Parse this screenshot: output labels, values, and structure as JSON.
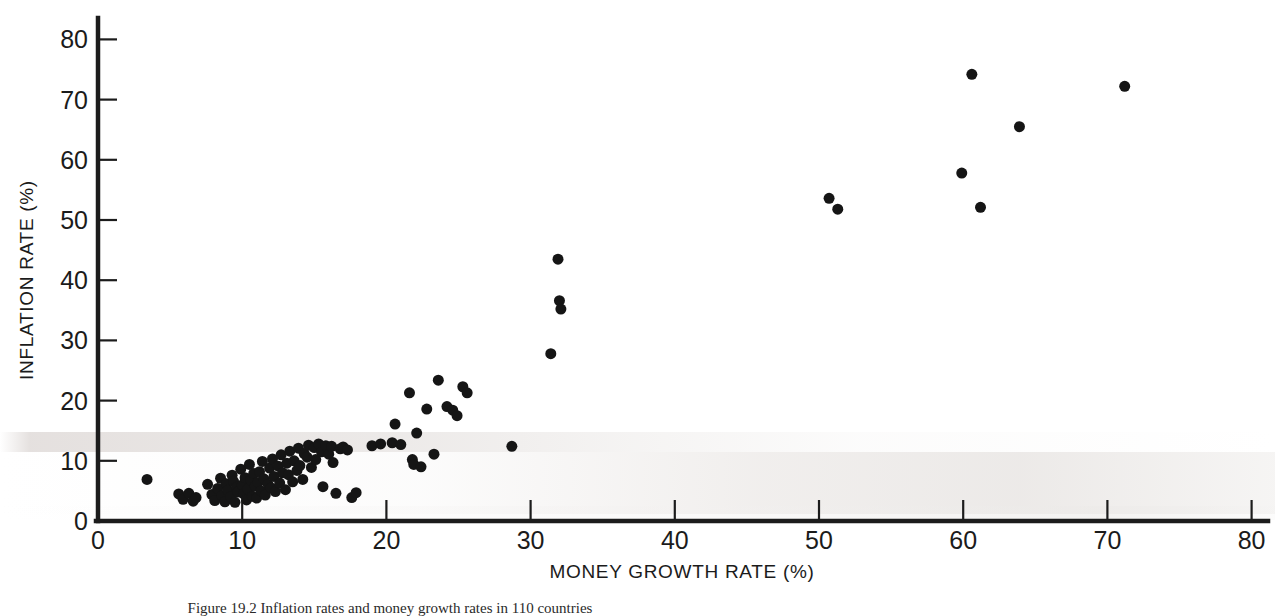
{
  "figure": {
    "background_color": "#ffffff",
    "ink_color": "#151515",
    "caption": "Figure 19.2  Inflation rates and money growth rates in 110 countries"
  },
  "chart_data": {
    "type": "scatter",
    "title": "",
    "xlabel": "MONEY GROWTH RATE (%)",
    "ylabel": "INFLATION RATE (%)",
    "xlim": [
      0,
      82
    ],
    "ylim": [
      0,
      83
    ],
    "xticks": [
      0,
      10,
      20,
      30,
      40,
      50,
      60,
      70,
      80
    ],
    "yticks": [
      0,
      10,
      20,
      30,
      40,
      50,
      60,
      70,
      80
    ],
    "xticklabels": [
      "0",
      "10",
      "20",
      "30",
      "40",
      "50",
      "60",
      "70",
      "80"
    ],
    "yticklabels": [
      "0",
      "10",
      "20",
      "30",
      "40",
      "50",
      "60",
      "70",
      "80"
    ],
    "grid": false,
    "legend": null,
    "marker": "filled-circle",
    "marker_color": "#151515",
    "marker_size_px": 11,
    "n_points": 110,
    "points": [
      [
        3.4,
        6.9
      ],
      [
        5.6,
        4.5
      ],
      [
        5.9,
        3.6
      ],
      [
        6.3,
        4.6
      ],
      [
        6.6,
        3.3
      ],
      [
        6.8,
        3.9
      ],
      [
        7.6,
        6.1
      ],
      [
        7.9,
        4.4
      ],
      [
        8.1,
        3.4
      ],
      [
        8.3,
        5.4
      ],
      [
        8.5,
        7.1
      ],
      [
        8.6,
        4.2
      ],
      [
        8.8,
        3.2
      ],
      [
        8.9,
        6.2
      ],
      [
        9.0,
        5.1
      ],
      [
        9.2,
        4.0
      ],
      [
        9.3,
        7.6
      ],
      [
        9.4,
        6.6
      ],
      [
        9.5,
        3.1
      ],
      [
        9.6,
        5.6
      ],
      [
        9.7,
        4.8
      ],
      [
        9.9,
        8.6
      ],
      [
        10.0,
        6.0
      ],
      [
        10.1,
        4.5
      ],
      [
        10.2,
        7.2
      ],
      [
        10.3,
        3.5
      ],
      [
        10.4,
        5.3
      ],
      [
        10.5,
        9.4
      ],
      [
        10.6,
        6.8
      ],
      [
        10.7,
        4.1
      ],
      [
        10.8,
        7.9
      ],
      [
        10.9,
        5.8
      ],
      [
        11.0,
        3.8
      ],
      [
        11.1,
        6.4
      ],
      [
        11.2,
        8.2
      ],
      [
        11.3,
        5.0
      ],
      [
        11.4,
        9.9
      ],
      [
        11.5,
        7.0
      ],
      [
        11.6,
        4.3
      ],
      [
        11.8,
        6.1
      ],
      [
        11.9,
        8.8
      ],
      [
        12.0,
        5.5
      ],
      [
        12.1,
        10.3
      ],
      [
        12.2,
        7.4
      ],
      [
        12.3,
        4.9
      ],
      [
        12.5,
        9.1
      ],
      [
        12.6,
        6.3
      ],
      [
        12.7,
        11.0
      ],
      [
        12.8,
        8.0
      ],
      [
        13.0,
        5.2
      ],
      [
        13.1,
        9.6
      ],
      [
        13.2,
        7.7
      ],
      [
        13.3,
        11.6
      ],
      [
        13.5,
        6.5
      ],
      [
        13.6,
        10.0
      ],
      [
        13.8,
        8.4
      ],
      [
        13.9,
        12.1
      ],
      [
        14.0,
        9.2
      ],
      [
        14.2,
        6.9
      ],
      [
        14.3,
        11.2
      ],
      [
        14.5,
        10.6
      ],
      [
        14.6,
        12.6
      ],
      [
        14.8,
        8.9
      ],
      [
        15.0,
        12.2
      ],
      [
        15.1,
        10.2
      ],
      [
        15.3,
        12.8
      ],
      [
        15.5,
        11.5
      ],
      [
        15.6,
        5.7
      ],
      [
        15.8,
        12.5
      ],
      [
        16.0,
        11.1
      ],
      [
        16.2,
        12.4
      ],
      [
        16.3,
        9.7
      ],
      [
        16.5,
        4.6
      ],
      [
        16.8,
        12.0
      ],
      [
        17.0,
        12.3
      ],
      [
        17.3,
        11.8
      ],
      [
        17.6,
        3.9
      ],
      [
        17.9,
        4.7
      ],
      [
        19.0,
        12.5
      ],
      [
        19.6,
        12.8
      ],
      [
        20.4,
        13.0
      ],
      [
        20.6,
        16.1
      ],
      [
        21.0,
        12.7
      ],
      [
        21.6,
        21.3
      ],
      [
        21.8,
        10.2
      ],
      [
        21.9,
        9.4
      ],
      [
        22.1,
        14.6
      ],
      [
        22.4,
        9.0
      ],
      [
        22.8,
        18.6
      ],
      [
        23.3,
        11.1
      ],
      [
        23.6,
        23.4
      ],
      [
        24.2,
        19.0
      ],
      [
        24.6,
        18.4
      ],
      [
        24.9,
        17.5
      ],
      [
        25.3,
        22.3
      ],
      [
        25.6,
        21.3
      ],
      [
        28.7,
        12.4
      ],
      [
        31.4,
        27.8
      ],
      [
        31.9,
        43.5
      ],
      [
        32.0,
        36.6
      ],
      [
        32.1,
        35.2
      ],
      [
        50.7,
        53.6
      ],
      [
        51.3,
        51.8
      ],
      [
        59.9,
        57.8
      ],
      [
        60.6,
        74.2
      ],
      [
        61.2,
        52.1
      ],
      [
        63.9,
        65.5
      ],
      [
        71.2,
        72.2
      ]
    ]
  },
  "axes": {
    "x_axis_name": "money-growth-rate-axis",
    "y_axis_name": "inflation-rate-axis"
  }
}
